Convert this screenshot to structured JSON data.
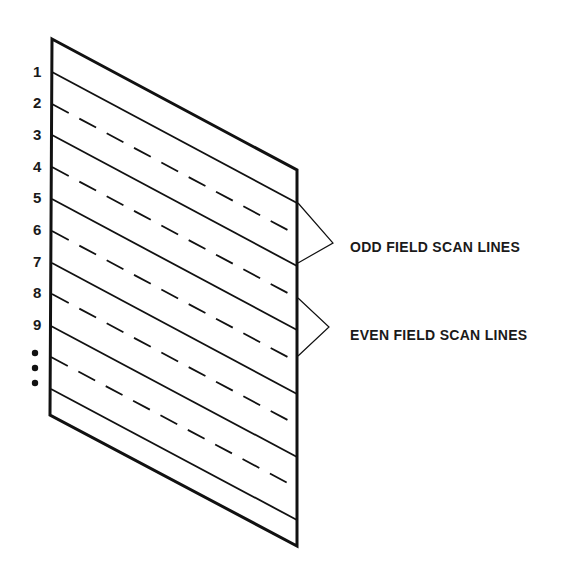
{
  "figure": {
    "line_numbers": [
      "1",
      "2",
      "3",
      "4",
      "5",
      "6",
      "7",
      "8",
      "9"
    ],
    "continuation": "ellipsis-dots",
    "lines": [
      {
        "index": 1,
        "style": "solid",
        "field": "odd"
      },
      {
        "index": 2,
        "style": "dashed",
        "field": "even"
      },
      {
        "index": 3,
        "style": "solid",
        "field": "odd"
      },
      {
        "index": 4,
        "style": "dashed",
        "field": "even"
      },
      {
        "index": 5,
        "style": "solid",
        "field": "odd"
      },
      {
        "index": 6,
        "style": "dashed",
        "field": "even"
      },
      {
        "index": 7,
        "style": "solid",
        "field": "odd"
      },
      {
        "index": 8,
        "style": "dashed",
        "field": "even"
      },
      {
        "index": 9,
        "style": "solid",
        "field": "odd"
      },
      {
        "index": 10,
        "style": "dashed",
        "field": "even"
      },
      {
        "index": 11,
        "style": "solid",
        "field": "odd"
      }
    ],
    "callouts": {
      "odd": "ODD FIELD SCAN LINES",
      "even": "EVEN FIELD SCAN LINES"
    },
    "colors": {
      "ink": "#111111",
      "background": "#ffffff"
    }
  }
}
